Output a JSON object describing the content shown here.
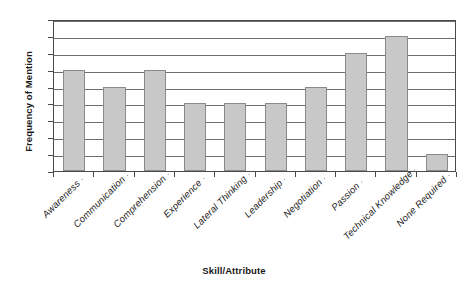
{
  "chart_data": {
    "type": "bar",
    "title": "",
    "xlabel": "Skill/Attribute",
    "ylabel": "Frequency of Mention",
    "categories": [
      "Awareness",
      "Communication",
      "Comprehension",
      "Experience",
      "Lateral Thinking",
      "Leadership",
      "Negotiation",
      "Passion",
      "Technical Knowledge",
      "None Required"
    ],
    "values": [
      6,
      5,
      6,
      4,
      4,
      4,
      5,
      7,
      8,
      1
    ],
    "ylim": [
      0,
      9
    ],
    "yticks": [
      "0",
      "1",
      "2",
      "3",
      "4",
      "5",
      "6",
      "7",
      "8",
      "9"
    ],
    "ytick_step": 1,
    "grid": true,
    "legend": false,
    "bar_color": "#c8c8c8",
    "bar_border_color": "#8a8a8a",
    "axis_color": "#4a4a4a",
    "gridline_color": "#6e6e6e",
    "background": "#ffffff",
    "xlabel_rotation": -45,
    "xtick_glyph": "·"
  }
}
